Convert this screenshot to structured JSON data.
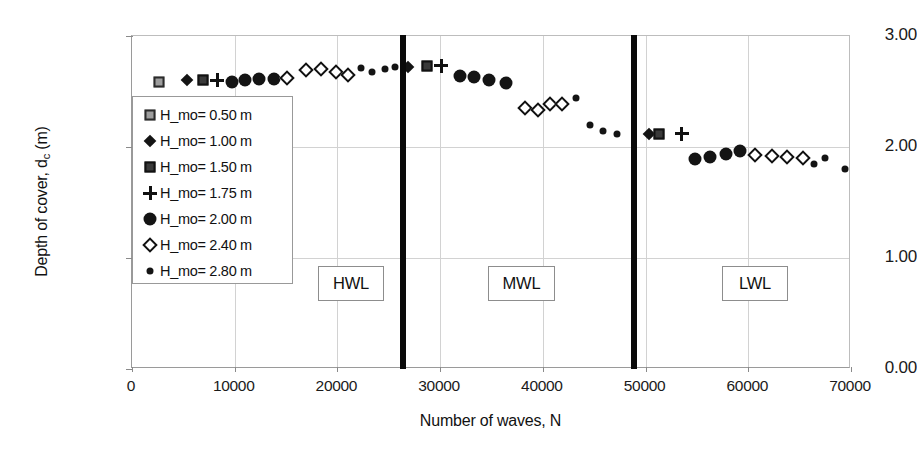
{
  "chart_data": {
    "type": "scatter",
    "title": "",
    "xlabel": "Number of waves, N",
    "ylabel": "Depth of cover, d_c (m)",
    "xlim": [
      0,
      70000
    ],
    "ylim": [
      0.0,
      3.0
    ],
    "xticks": [
      0,
      10000,
      20000,
      30000,
      40000,
      50000,
      60000,
      70000
    ],
    "xtick_labels": [
      "0",
      "10000",
      "20000",
      "30000",
      "40000",
      "50000",
      "60000",
      "70000"
    ],
    "yticks": [
      0.0,
      1.0,
      2.0,
      3.0
    ],
    "ytick_labels": [
      "0.00",
      "1.00",
      "2.00",
      "3.00"
    ],
    "grid": "vertical-and-horizontal-light",
    "legend_position": "upper-left-inside",
    "series": [
      {
        "name": "H_mo= 0.50 m",
        "marker": "square-gray",
        "points": [
          [
            2600,
            2.59
          ]
        ]
      },
      {
        "name": "H_mo= 1.00 m",
        "marker": "diamond-filled",
        "points": [
          [
            5400,
            2.6
          ],
          [
            26900,
            2.72
          ],
          [
            50300,
            2.12
          ]
        ]
      },
      {
        "name": "H_mo= 1.50 m",
        "marker": "square-dark",
        "points": [
          [
            6900,
            2.6
          ],
          [
            28700,
            2.73
          ],
          [
            51300,
            2.12
          ]
        ]
      },
      {
        "name": "H_mo= 1.75 m",
        "marker": "plus",
        "points": [
          [
            8300,
            2.6
          ],
          [
            30100,
            2.73
          ],
          [
            53500,
            2.12
          ]
        ]
      },
      {
        "name": "H_mo= 2.00 m",
        "marker": "circle-large",
        "points": [
          [
            9700,
            2.59
          ],
          [
            11000,
            2.6
          ],
          [
            12400,
            2.61
          ],
          [
            13800,
            2.61
          ],
          [
            31900,
            2.64
          ],
          [
            33300,
            2.63
          ],
          [
            34800,
            2.6
          ],
          [
            36400,
            2.58
          ],
          [
            54800,
            1.89
          ],
          [
            56300,
            1.91
          ],
          [
            57800,
            1.94
          ],
          [
            59200,
            1.96
          ]
        ]
      },
      {
        "name": "H_mo= 2.40 m",
        "marker": "diamond-open",
        "points": [
          [
            15100,
            2.62
          ],
          [
            16900,
            2.69
          ],
          [
            18400,
            2.7
          ],
          [
            19900,
            2.68
          ],
          [
            21000,
            2.65
          ],
          [
            38300,
            2.35
          ],
          [
            39500,
            2.33
          ],
          [
            40700,
            2.39
          ],
          [
            41900,
            2.39
          ],
          [
            60700,
            1.93
          ],
          [
            62300,
            1.92
          ],
          [
            63800,
            1.91
          ],
          [
            65300,
            1.9
          ]
        ]
      },
      {
        "name": "H_mo= 2.80 m",
        "marker": "circle-small",
        "points": [
          [
            22300,
            2.71
          ],
          [
            23400,
            2.68
          ],
          [
            24600,
            2.7
          ],
          [
            25600,
            2.72
          ],
          [
            43200,
            2.44
          ],
          [
            44600,
            2.2
          ],
          [
            45900,
            2.14
          ],
          [
            47200,
            2.12
          ],
          [
            66400,
            1.85
          ],
          [
            67500,
            1.9
          ],
          [
            69400,
            1.8
          ]
        ]
      }
    ],
    "region_markers": [
      {
        "label": "HWL",
        "divider_x": 26700,
        "box_center_x": 16700
      },
      {
        "label": "MWL",
        "divider_x": 49200,
        "box_center_x": 38500
      },
      {
        "label": "LWL",
        "divider_x": null,
        "box_center_x": 62300
      }
    ]
  }
}
